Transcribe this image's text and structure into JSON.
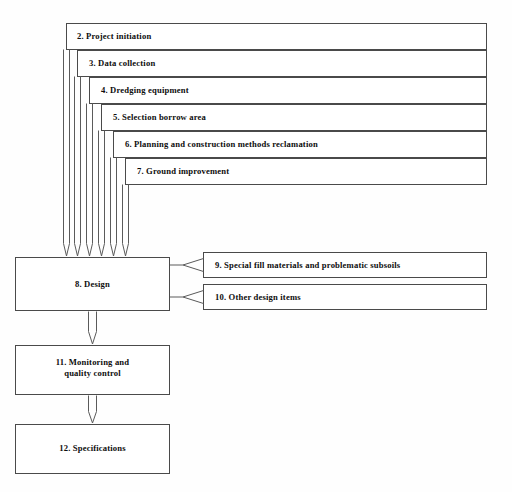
{
  "diagram": {
    "type": "flowchart",
    "background_color": "#fefefe",
    "line_color": "#4a4a4a",
    "text_color": "#0d0d0d",
    "nested_boxes": [
      {
        "id": "box-2",
        "label": "2. Project initiation",
        "x": 66,
        "y": 23,
        "w": 421,
        "h": 27
      },
      {
        "id": "box-3",
        "label": "3. Data collection",
        "x": 77,
        "y": 50,
        "w": 410,
        "h": 27
      },
      {
        "id": "box-4",
        "label": "4. Dredging equipment",
        "x": 89,
        "y": 77,
        "w": 398,
        "h": 27
      },
      {
        "id": "box-5",
        "label": "5. Selection borrow area",
        "x": 101,
        "y": 104,
        "w": 386,
        "h": 27
      },
      {
        "id": "box-6",
        "label": "6. Planning and construction methods reclamation",
        "x": 113,
        "y": 131,
        "w": 374,
        "h": 27
      },
      {
        "id": "box-7",
        "label": "7. Ground improvement",
        "x": 125,
        "y": 158,
        "w": 362,
        "h": 27
      }
    ],
    "main_boxes": [
      {
        "id": "box-8",
        "label": "8. Design",
        "x": 15,
        "y": 257,
        "w": 155,
        "h": 54
      },
      {
        "id": "box-11",
        "label": "11. Monitoring and\nquality control",
        "x": 15,
        "y": 345,
        "w": 155,
        "h": 50
      },
      {
        "id": "box-12",
        "label": "12. Specifications",
        "x": 15,
        "y": 424,
        "w": 155,
        "h": 50
      }
    ],
    "side_boxes": [
      {
        "id": "box-9",
        "label": "9. Special fill materials and problematic subsoils",
        "x": 203,
        "y": 252,
        "w": 284,
        "h": 26
      },
      {
        "id": "box-10",
        "label": "10. Other design items",
        "x": 203,
        "y": 284,
        "w": 284,
        "h": 26
      }
    ],
    "connectors": [
      {
        "from": "box-2",
        "to": "box-8",
        "kind": "elbow-down-arrow"
      },
      {
        "from": "box-3",
        "to": "box-8",
        "kind": "elbow-down-arrow"
      },
      {
        "from": "box-4",
        "to": "box-8",
        "kind": "elbow-down-arrow"
      },
      {
        "from": "box-5",
        "to": "box-8",
        "kind": "elbow-down-arrow"
      },
      {
        "from": "box-6",
        "to": "box-8",
        "kind": "elbow-down-arrow"
      },
      {
        "from": "box-7",
        "to": "box-8",
        "kind": "elbow-down-arrow"
      },
      {
        "from": "box-9",
        "to": "box-8",
        "kind": "left-arrow"
      },
      {
        "from": "box-10",
        "to": "box-8",
        "kind": "left-arrow"
      },
      {
        "from": "box-8",
        "to": "box-11",
        "kind": "down-arrow"
      },
      {
        "from": "box-11",
        "to": "box-12",
        "kind": "down-arrow"
      }
    ]
  }
}
